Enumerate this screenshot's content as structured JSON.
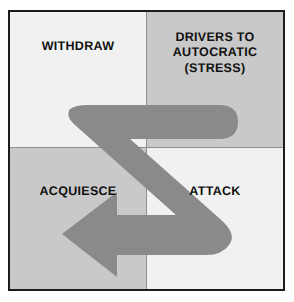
{
  "diagram": {
    "frame_border_color": "#1c1c1c",
    "divider_color": "#8e8e8e",
    "page_background": "#ffffff"
  },
  "quadrants": [
    {
      "key": "withdraw",
      "label": "WITHDRAW",
      "position": "top-left",
      "background": "#f1f1f1",
      "text_color": "#111111"
    },
    {
      "key": "drivers-to-autocratic",
      "label": "DRIVERS TO\nAUTOCRATIC\n(STRESS)",
      "position": "top-right",
      "background": "#c9c9c9",
      "text_color": "#111111"
    },
    {
      "key": "acquiesce",
      "label": "ACQUIESCE",
      "position": "bottom-left",
      "background": "#c9c9c9",
      "text_color": "#111111"
    },
    {
      "key": "attack",
      "label": "ATTACK",
      "position": "bottom-right",
      "background": "#f1f1f1",
      "text_color": "#111111"
    }
  ],
  "arrow": {
    "name": "z-shaped-flow-arrow",
    "color": "#8a8a8a",
    "direction": "ends pointing left into ACQUIESCE",
    "path_description": "Starts at upper-left of WITHDRAW, runs right across into DRIVERS TO AUTOCRATIC, turns back diagonally down-left through the centre, then down-right into ATTACK, then turns and runs left ending in an arrowhead in ACQUIESCE"
  }
}
